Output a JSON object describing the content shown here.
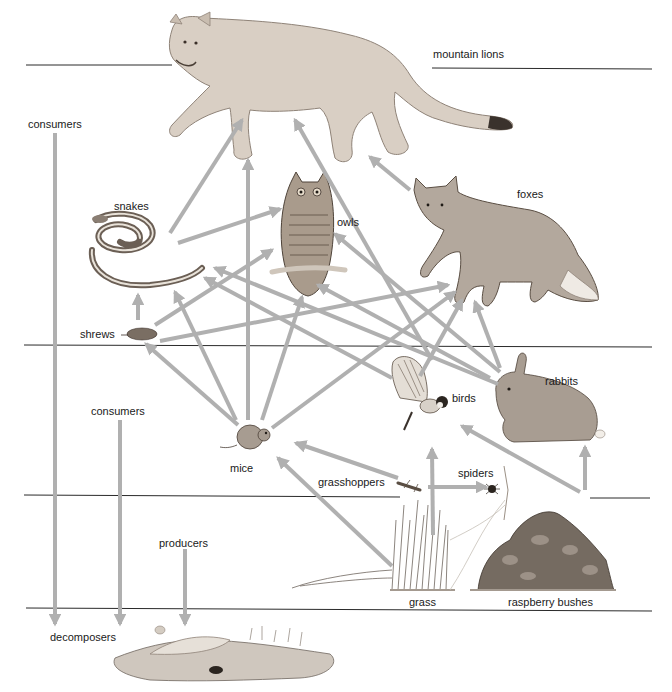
{
  "diagram": {
    "type": "food-web",
    "colors": {
      "arrow": "#b0b0b0",
      "divider": "#2a2a2a",
      "text": "#1a1a1a",
      "background": "#ffffff"
    },
    "levels": [
      {
        "id": "top",
        "members": [
          "mountain lions"
        ]
      },
      {
        "id": "upper-consumers",
        "members": [
          "snakes",
          "owls",
          "foxes",
          "shrews"
        ]
      },
      {
        "id": "lower-consumers",
        "members": [
          "mice",
          "birds",
          "rabbits",
          "grasshoppers",
          "spiders"
        ]
      },
      {
        "id": "producers",
        "members": [
          "grass",
          "raspberry bushes"
        ]
      },
      {
        "id": "decomposers",
        "members": [
          "decomposers"
        ]
      }
    ],
    "side_labels": {
      "consumers_upper": "consumers",
      "consumers_lower": "consumers",
      "producers": "producers",
      "decomposers": "decomposers"
    },
    "organisms": {
      "mountain_lions": "mountain lions",
      "snakes": "snakes",
      "owls": "owls",
      "foxes": "foxes",
      "shrews": "shrews",
      "mice": "mice",
      "birds": "birds",
      "rabbits": "rabbits",
      "grasshoppers": "grasshoppers",
      "spiders": "spiders",
      "grass": "grass",
      "raspberry_bushes": "raspberry bushes"
    },
    "edges": [
      {
        "from": "snakes",
        "to": "mountain lions"
      },
      {
        "from": "mice",
        "to": "mountain lions"
      },
      {
        "from": "birds",
        "to": "mountain lions"
      },
      {
        "from": "foxes",
        "to": "mountain lions"
      },
      {
        "from": "snakes",
        "to": "owls"
      },
      {
        "from": "shrews",
        "to": "owls"
      },
      {
        "from": "mice",
        "to": "owls"
      },
      {
        "from": "birds",
        "to": "owls"
      },
      {
        "from": "rabbits",
        "to": "owls"
      },
      {
        "from": "shrews",
        "to": "snakes"
      },
      {
        "from": "mice",
        "to": "snakes"
      },
      {
        "from": "birds",
        "to": "snakes"
      },
      {
        "from": "rabbits",
        "to": "snakes"
      },
      {
        "from": "shrews",
        "to": "foxes"
      },
      {
        "from": "mice",
        "to": "foxes"
      },
      {
        "from": "birds",
        "to": "foxes"
      },
      {
        "from": "rabbits",
        "to": "foxes"
      },
      {
        "from": "mice",
        "to": "shrews"
      },
      {
        "from": "grasshoppers",
        "to": "mice"
      },
      {
        "from": "grass",
        "to": "mice"
      },
      {
        "from": "grass",
        "to": "birds"
      },
      {
        "from": "raspberry bushes",
        "to": "birds"
      },
      {
        "from": "raspberry bushes",
        "to": "rabbits"
      },
      {
        "from": "grasshoppers",
        "to": "spiders"
      },
      {
        "from": "consumers",
        "to": "decomposers"
      },
      {
        "from": "producers",
        "to": "decomposers"
      }
    ]
  }
}
